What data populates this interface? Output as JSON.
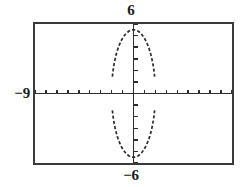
{
  "figure": {
    "type": "graphing-calculator-screen",
    "labels": {
      "ymax": "6",
      "ymin": "−6",
      "xmin": "−9"
    }
  },
  "chart_data": {
    "type": "line",
    "title": "",
    "subtitle": "",
    "xlabel": "",
    "ylabel": "",
    "xlim": [
      -9,
      9
    ],
    "ylim": [
      -6,
      6
    ],
    "xscl": 1,
    "yscl": 1,
    "grid": false,
    "legend": null,
    "axis_tick_labels": {
      "top": "6",
      "bottom": "−6",
      "left": "−9",
      "right": ""
    },
    "curve_description": "vertically elongated ellipse centered at the origin, drawn as a broken/dashed pixel trace with gaps where the branches approach the x-axis",
    "curve": {
      "shape": "ellipse",
      "center": [
        0,
        0
      ],
      "semi_axis_x": 2,
      "semi_axis_y": 5.5,
      "x_intercepts": [
        -2,
        2
      ],
      "y_intercepts": [
        -5.5,
        5.5
      ],
      "equation": "x^2/4 + y^2/30.25 = 1"
    },
    "series": [
      {
        "name": "upper branch",
        "x": [
          -2.0,
          -1.9,
          -1.75,
          -1.55,
          -1.3,
          -1.0,
          -0.6,
          -0.2,
          0.2,
          0.6,
          1.0,
          1.3,
          1.55,
          1.75,
          1.9,
          2.0
        ],
        "y": [
          0.0,
          1.72,
          2.66,
          3.48,
          4.18,
          4.76,
          5.24,
          5.45,
          5.45,
          5.24,
          4.76,
          4.18,
          3.48,
          2.66,
          1.72,
          0.0
        ]
      },
      {
        "name": "lower branch",
        "x": [
          -2.0,
          -1.9,
          -1.75,
          -1.55,
          -1.3,
          -1.0,
          -0.6,
          -0.2,
          0.2,
          0.6,
          1.0,
          1.3,
          1.55,
          1.75,
          1.9,
          2.0
        ],
        "y": [
          0.0,
          -1.72,
          -2.66,
          -3.48,
          -4.18,
          -4.76,
          -5.24,
          -5.45,
          -5.45,
          -5.24,
          -4.76,
          -4.18,
          -3.48,
          -2.66,
          -1.72,
          0.0
        ]
      }
    ],
    "colors": {
      "frame": "#3a3a3a",
      "axis": "#2e2e2e",
      "curve": "#2b2b2b",
      "background": "#ffffff",
      "label_text": "#1a1a1a"
    }
  }
}
